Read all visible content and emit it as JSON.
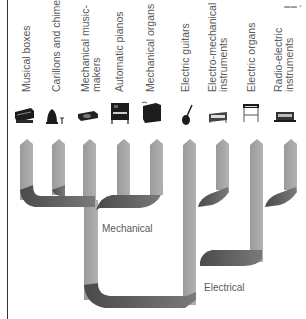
{
  "diagram": {
    "type": "family-tree",
    "categories": [
      {
        "id": "musical-boxes",
        "label": "Musical boxes",
        "group": "Mechanical"
      },
      {
        "id": "carillons",
        "label": "Carillons and chimes",
        "group": "Mechanical"
      },
      {
        "id": "mech-music-makers",
        "label_line1": "Mechanical music-",
        "label_line2": "makers",
        "group": "Mechanical"
      },
      {
        "id": "automatic-pianos",
        "label": "Automatic pianos",
        "group": "Mechanical"
      },
      {
        "id": "mechanical-organs",
        "label": "Mechanical organs",
        "group": "Mechanical"
      },
      {
        "id": "electric-guitars",
        "label": "Electric guitars",
        "group": "Electrical"
      },
      {
        "id": "electro-mechanical",
        "label_line1": "Electro-mechanical",
        "label_line2": "instruments",
        "group": "Electrical"
      },
      {
        "id": "electric-organs",
        "label": "Electric organs",
        "group": "Electrical"
      },
      {
        "id": "radio-electric",
        "label_line1": "Radio-electric",
        "label_line2": "instruments",
        "group": "Electrical"
      }
    ],
    "groups": {
      "mechanical": "Mechanical",
      "electrical": "Electrical"
    },
    "colors": {
      "branch": "#a3a3a3",
      "branch_shadow": "#555555",
      "text": "#5a5a5a",
      "frame": "#333333"
    }
  }
}
